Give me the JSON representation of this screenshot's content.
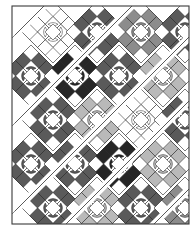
{
  "figure": {
    "width": 195,
    "height": 230,
    "background": "#ffffff"
  },
  "palette": {
    "white": "#ffffff",
    "light_gray": "#b9b9b9",
    "mid_gray": "#8c8c8c",
    "dark_gray": "#5a5a5a",
    "black": "#262626",
    "outline": "#1a1a1a",
    "border_line": "#3a3a3a",
    "sashing": "#ffffff"
  },
  "legend_values": [
    {
      "name": "white",
      "label": "White",
      "color": "#ffffff"
    },
    {
      "name": "light-gray",
      "label": "Light gray",
      "color": "#b9b9b9"
    },
    {
      "name": "mid-gray",
      "label": "Medium gray",
      "color": "#8c8c8c"
    },
    {
      "name": "dark-gray",
      "label": "Dark gray",
      "color": "#5a5a5a"
    },
    {
      "name": "black",
      "label": "Black",
      "color": "#262626"
    }
  ],
  "layout": {
    "set": "on-point",
    "block_pitch_x": 44,
    "block_pitch_y": 44,
    "block_half_diagonal": 31,
    "origin_x": 31,
    "origin_y": 10,
    "rows": 9,
    "border": {
      "stroke": "#3a3a3a",
      "stroke_width": 1.1,
      "inset_left": 12,
      "inset_top": 6,
      "inset_right": 6,
      "inset_bottom": 6
    }
  },
  "blocks": [
    {
      "id": "r0c0",
      "cx": 53,
      "cy": 32,
      "shade": "white",
      "motif": "leaf"
    },
    {
      "id": "r0c1",
      "cx": 97,
      "cy": 32,
      "shade": "dark_gray",
      "motif": "leaf"
    },
    {
      "id": "r0c2",
      "cx": 141,
      "cy": 32,
      "shade": "mid_gray",
      "motif": "leaf"
    },
    {
      "id": "r0c3",
      "cx": 185,
      "cy": 32,
      "shade": "dark_gray",
      "motif": "leaf"
    },
    {
      "id": "r1c0",
      "cx": 31,
      "cy": 76,
      "shade": "dark_gray",
      "motif": "leaf"
    },
    {
      "id": "r1c1",
      "cx": 75,
      "cy": 76,
      "shade": "black",
      "motif": "leaf"
    },
    {
      "id": "r1c2",
      "cx": 119,
      "cy": 76,
      "shade": "dark_gray",
      "motif": "leaf"
    },
    {
      "id": "r1c3",
      "cx": 163,
      "cy": 76,
      "shade": "light_gray",
      "motif": "leaf"
    },
    {
      "id": "r2c0",
      "cx": 53,
      "cy": 120,
      "shade": "dark_gray",
      "motif": "leaf"
    },
    {
      "id": "r2c1",
      "cx": 97,
      "cy": 120,
      "shade": "light_gray",
      "motif": "leaf"
    },
    {
      "id": "r2c2",
      "cx": 141,
      "cy": 120,
      "shade": "white",
      "motif": "leaf"
    },
    {
      "id": "r2c3",
      "cx": 185,
      "cy": 120,
      "shade": "dark_gray",
      "motif": "leaf"
    },
    {
      "id": "r3c0",
      "cx": 31,
      "cy": 164,
      "shade": "dark_gray",
      "motif": "leaf"
    },
    {
      "id": "r3c1",
      "cx": 75,
      "cy": 164,
      "shade": "dark_gray",
      "motif": "leaf"
    },
    {
      "id": "r3c2",
      "cx": 119,
      "cy": 164,
      "shade": "black",
      "motif": "leaf"
    },
    {
      "id": "r3c3",
      "cx": 163,
      "cy": 164,
      "shade": "light_gray",
      "motif": "leaf"
    },
    {
      "id": "r4c0",
      "cx": 53,
      "cy": 208,
      "shade": "dark_gray",
      "motif": "leaf"
    },
    {
      "id": "r4c1",
      "cx": 97,
      "cy": 208,
      "shade": "light_gray",
      "motif": "leaf"
    },
    {
      "id": "r4c2",
      "cx": 141,
      "cy": 208,
      "shade": "dark_gray",
      "motif": "leaf"
    },
    {
      "id": "r4c3",
      "cx": 185,
      "cy": 208,
      "shade": "mid_gray",
      "motif": "leaf"
    }
  ],
  "sashing_lines": [
    {
      "id": "s0",
      "x1": 10,
      "y1": 40,
      "x2": 96,
      "y2": -46
    },
    {
      "id": "s1",
      "x1": 10,
      "y1": 128,
      "x2": 184,
      "y2": -46
    },
    {
      "id": "s2",
      "x1": 10,
      "y1": 216,
      "x2": 228,
      "y2": -2
    },
    {
      "id": "s3",
      "x1": 54,
      "y1": 236,
      "x2": 228,
      "y2": 62
    },
    {
      "id": "s4",
      "x1": 142,
      "y1": 236,
      "x2": 228,
      "y2": 150
    }
  ]
}
